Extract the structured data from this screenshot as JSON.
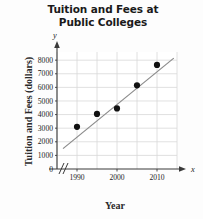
{
  "chart_data": {
    "type": "scatter",
    "title": "Tuition and Fees at Public Colleges",
    "title_lines": [
      "Tuition and Fees at",
      "Public Colleges"
    ],
    "xlabel": "Year",
    "ylabel": "Tuition and Fees (dollars)",
    "x_axis_variable": "x",
    "y_axis_variable": "y",
    "x": [
      1990,
      1995,
      2000,
      2005,
      2010
    ],
    "values": [
      3100,
      4050,
      4450,
      6150,
      7650
    ],
    "points": [
      {
        "x": 1990,
        "y": 3100
      },
      {
        "x": 1995,
        "y": 4050
      },
      {
        "x": 2000,
        "y": 4450
      },
      {
        "x": 2005,
        "y": 6150
      },
      {
        "x": 2010,
        "y": 7650
      }
    ],
    "xlim": [
      1985,
      2015
    ],
    "ylim": [
      0,
      8600
    ],
    "x_ticklabels": [
      "1990",
      "2000",
      "2010"
    ],
    "x_ticks": [
      1990,
      2000,
      2010
    ],
    "y_ticklabels": [
      "0",
      "1000",
      "2000",
      "3000",
      "4000",
      "5000",
      "6000",
      "7000",
      "8000"
    ],
    "y_ticks": [
      0,
      1000,
      2000,
      3000,
      4000,
      5000,
      6000,
      7000,
      8000
    ],
    "grid": true,
    "grid_x_step": 5,
    "grid_y_step": 1000,
    "legend": null,
    "axis_break": true,
    "axis_break_symbol": "//",
    "trendline": {
      "type": "line",
      "x_start": 1986.5,
      "y_start": 1500,
      "x_end": 2014.2,
      "y_end": 8150
    },
    "colors": {
      "point": "#111111",
      "trendline": "#8a8a8a",
      "grid": "#d8d8d8",
      "axis": "#3a3a3a",
      "background": "#fdfdfd",
      "text": "#222222"
    }
  }
}
